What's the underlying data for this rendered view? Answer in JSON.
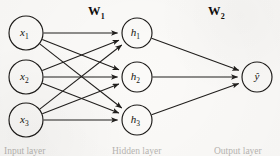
{
  "figure": {
    "type": "neural-network-diagram",
    "background_color": "#fbfaf8",
    "stroke_color": "#201e1c"
  },
  "weights": [
    {
      "id": "w1",
      "label": "W",
      "subscript": "1",
      "x": 88,
      "y": 4
    },
    {
      "id": "w2",
      "label": "W",
      "subscript": "2",
      "x": 208,
      "y": 4
    }
  ],
  "layers": [
    {
      "id": "input",
      "caption": "Input layer",
      "caption_x": 4,
      "radius": 17,
      "nodes": [
        {
          "id": "x1",
          "label": "x",
          "subscript": "1",
          "cx": 26,
          "cy": 33
        },
        {
          "id": "x2",
          "label": "x",
          "subscript": "2",
          "cx": 26,
          "cy": 77
        },
        {
          "id": "x3",
          "label": "x",
          "subscript": "3",
          "cx": 26,
          "cy": 120
        }
      ]
    },
    {
      "id": "hidden",
      "caption": "Hidden layer",
      "caption_x": 112,
      "radius": 15,
      "nodes": [
        {
          "id": "h1",
          "label": "h",
          "subscript": "1",
          "cx": 137,
          "cy": 33
        },
        {
          "id": "h2",
          "label": "h",
          "subscript": "2",
          "cx": 137,
          "cy": 77
        },
        {
          "id": "h3",
          "label": "h",
          "subscript": "3",
          "cx": 137,
          "cy": 120
        }
      ]
    },
    {
      "id": "output",
      "caption": "Output layer",
      "caption_x": 214,
      "radius": 15,
      "nodes": [
        {
          "id": "yhat",
          "label": "ŷ",
          "subscript": "",
          "cx": 257,
          "cy": 77
        }
      ]
    }
  ],
  "edges": [
    {
      "from": "x1",
      "to": "h1"
    },
    {
      "from": "x1",
      "to": "h2"
    },
    {
      "from": "x1",
      "to": "h3"
    },
    {
      "from": "x2",
      "to": "h1"
    },
    {
      "from": "x2",
      "to": "h2"
    },
    {
      "from": "x2",
      "to": "h3"
    },
    {
      "from": "x3",
      "to": "h1"
    },
    {
      "from": "x3",
      "to": "h2"
    },
    {
      "from": "x3",
      "to": "h3"
    },
    {
      "from": "h1",
      "to": "yhat"
    },
    {
      "from": "h2",
      "to": "yhat"
    },
    {
      "from": "h3",
      "to": "yhat"
    }
  ]
}
